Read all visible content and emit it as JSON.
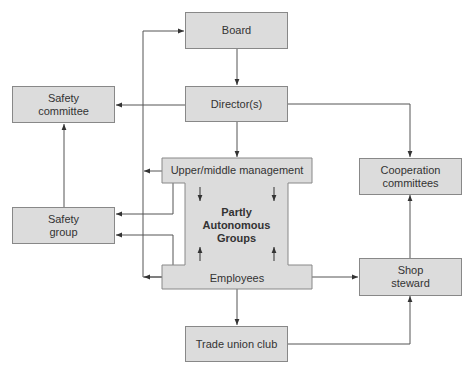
{
  "diagram": {
    "type": "organizational-flow",
    "nodes": {
      "board": {
        "label": "Board"
      },
      "directors": {
        "label": "Director(s)"
      },
      "safety_committee": {
        "label": "Safety\ncommittee",
        "line1": "Safety",
        "line2": "committee"
      },
      "upper_middle_management": {
        "label": "Upper/middle management"
      },
      "partly_autonomous_groups": {
        "label": "Partly Autonomous Groups",
        "line1": "Partly",
        "line2": "Autonomous",
        "line3": "Groups"
      },
      "employees": {
        "label": "Employees"
      },
      "safety_group": {
        "label": "Safety\ngroup",
        "line1": "Safety",
        "line2": "group"
      },
      "cooperation_committees": {
        "label": "Cooperation\ncommittees",
        "line1": "Cooperation",
        "line2": "committees"
      },
      "shop_steward": {
        "label": "Shop\nsteward",
        "line1": "Shop",
        "line2": "steward"
      },
      "trade_union_club": {
        "label": "Trade union club"
      }
    },
    "edges": [
      {
        "from": "board",
        "to": "directors"
      },
      {
        "from": "directors",
        "to": "safety_committee"
      },
      {
        "from": "directors",
        "to": "upper_middle_management"
      },
      {
        "from": "directors",
        "to": "cooperation_committees"
      },
      {
        "from": "safety_group",
        "to": "safety_committee"
      },
      {
        "from": "upper_middle_management",
        "to": "safety_group"
      },
      {
        "from": "employees",
        "to": "safety_group"
      },
      {
        "from": "upper_middle_management",
        "to": "partly_autonomous_groups"
      },
      {
        "from": "employees",
        "to": "partly_autonomous_groups"
      },
      {
        "from": "employees",
        "to": "shop_steward"
      },
      {
        "from": "employees",
        "to": "trade_union_club"
      },
      {
        "from": "trade_union_club",
        "to": "shop_steward"
      },
      {
        "from": "shop_steward",
        "to": "cooperation_committees"
      },
      {
        "from": "feedback-bus",
        "to": "board"
      },
      {
        "from": "feedback-bus",
        "to": "upper_middle_management"
      },
      {
        "from": "feedback-bus",
        "to": "employees"
      }
    ],
    "colors": {
      "box_fill": "#dcdcdc",
      "box_border": "#888888",
      "line": "#555555",
      "background": "#ffffff"
    }
  }
}
